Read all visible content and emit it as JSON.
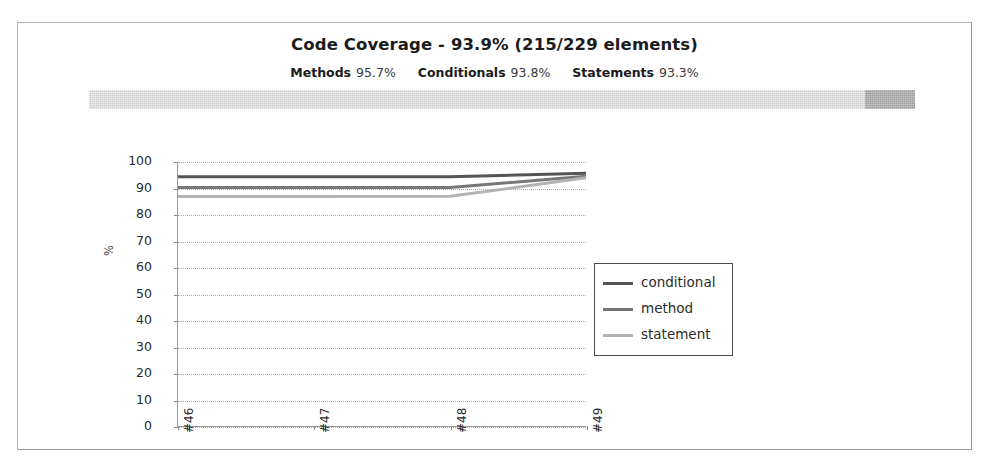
{
  "report": {
    "title": "Code Coverage - 93.9% (215/229 elements)",
    "overall_percent": "93.9%",
    "covered_elements": "215",
    "total_elements": "229",
    "metrics": [
      {
        "label": "Methods",
        "value": "95.7%"
      },
      {
        "label": "Conditionals",
        "value": "93.8%"
      },
      {
        "label": "Statements",
        "value": "93.3%"
      }
    ],
    "coverage_bar": {
      "covered_percent": 93.9,
      "uncovered_percent": 6.1,
      "covered_color": "#cccccc",
      "uncovered_color": "#9d9d9d"
    }
  },
  "chart_data": {
    "type": "line",
    "title": "",
    "xlabel": "",
    "ylabel": "%",
    "ylim": [
      0,
      100
    ],
    "ytick_step": 10,
    "yticks": [
      "100",
      "90",
      "80",
      "70",
      "60",
      "50",
      "40",
      "30",
      "20",
      "10",
      "0"
    ],
    "categories": [
      "#46",
      "#47",
      "#48",
      "#49"
    ],
    "grid": true,
    "legend_position": "right",
    "series": [
      {
        "name": "conditional",
        "values": [
          94.4,
          94.4,
          94.4,
          95.7
        ],
        "color": "#555555"
      },
      {
        "name": "method",
        "values": [
          90.3,
          90.3,
          90.3,
          94.6
        ],
        "color": "#777777"
      },
      {
        "name": "statement",
        "values": [
          86.9,
          86.9,
          87.0,
          94.0
        ],
        "color": "#b3b3b3"
      }
    ]
  }
}
